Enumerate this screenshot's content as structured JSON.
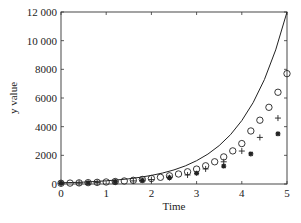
{
  "chart_data": {
    "type": "scatter",
    "title": "",
    "xlabel": "Time",
    "ylabel": "y value",
    "xlim": [
      0,
      5
    ],
    "ylim": [
      0,
      12000
    ],
    "xticks": [
      0,
      1,
      2,
      3,
      4,
      5
    ],
    "xtick_labels": [
      "0",
      "1",
      "2",
      "3",
      "4",
      "5"
    ],
    "yticks": [
      0,
      2000,
      4000,
      6000,
      8000,
      10000,
      12000
    ],
    "ytick_labels": [
      "0",
      "2000",
      "4000",
      "6000",
      "8000",
      "10 000",
      "12 000"
    ],
    "grid": false,
    "legend": null,
    "series": [
      {
        "name": "exact solution",
        "style": "line",
        "color": "#222222",
        "x": [
          0,
          0.25,
          0.5,
          0.75,
          1,
          1.25,
          1.5,
          1.75,
          2,
          2.25,
          2.5,
          2.75,
          3,
          3.25,
          3.5,
          3.75,
          4,
          4.25,
          4.5,
          4.75,
          5
        ],
        "y": [
          81,
          104,
          134,
          172,
          220,
          283,
          363,
          466,
          598,
          768,
          986,
          1266,
          1626,
          2088,
          2680,
          3442,
          4420,
          5675,
          7287,
          9357,
          12000
        ]
      },
      {
        "name": "circles",
        "style": "open-circle",
        "color": "#222222",
        "x": [
          0,
          0.2,
          0.4,
          0.6,
          0.8,
          1.0,
          1.2,
          1.4,
          1.6,
          1.8,
          2.0,
          2.2,
          2.4,
          2.6,
          2.8,
          3.0,
          3.2,
          3.4,
          3.6,
          3.8,
          4.0,
          4.2,
          4.4,
          4.6,
          4.8,
          5.0
        ],
        "y": [
          52,
          64,
          78,
          95,
          116,
          141,
          173,
          211,
          257,
          314,
          384,
          468,
          572,
          698,
          852,
          1040,
          1270,
          1550,
          1890,
          2310,
          2820,
          3700,
          4450,
          5350,
          6400,
          7700
        ]
      },
      {
        "name": "plus",
        "style": "plus",
        "color": "#222222",
        "x": [
          0,
          0.4,
          0.8,
          1.2,
          1.6,
          2.0,
          2.4,
          2.8,
          3.2,
          3.6,
          4.0,
          4.4,
          4.8
        ],
        "y": [
          52,
          74,
          106,
          152,
          216,
          309,
          442,
          630,
          1050,
          1550,
          2300,
          3250,
          4600
        ]
      },
      {
        "name": "stars",
        "style": "star",
        "color": "#222222",
        "x": [
          0,
          0.6,
          1.2,
          1.8,
          2.4,
          3.0,
          3.6,
          4.2,
          4.8
        ],
        "y": [
          52,
          82,
          150,
          260,
          450,
          750,
          1250,
          2100,
          3500
        ]
      }
    ]
  }
}
